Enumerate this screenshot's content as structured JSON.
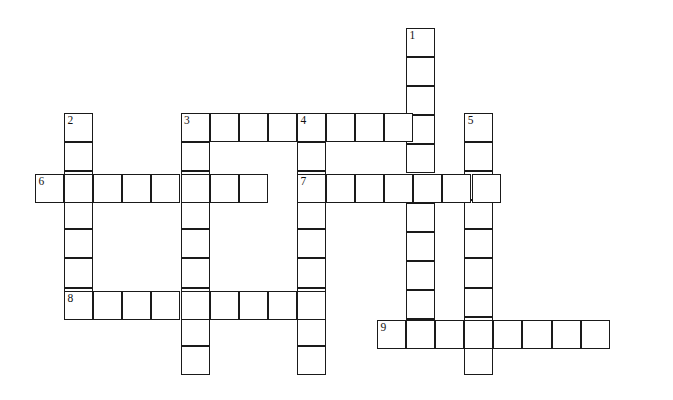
{
  "puzzle": {
    "type": "crossword-grid",
    "title": "Crossword Puzzle Grid",
    "ink_color": "#1a1a1a",
    "cell_color": "#ffffff",
    "background_color": "#ffffff",
    "cell_size": 29.1,
    "origin": {
      "x": 35,
      "y": 28
    },
    "grid_columns": 21,
    "grid_rows": 13,
    "entries": [
      {
        "number": "1",
        "direction": "down",
        "col": 12.75,
        "row": 0,
        "length": 11
      },
      {
        "number": "2",
        "direction": "down",
        "col": 1,
        "row": 2.92,
        "length": 7
      },
      {
        "number": "3",
        "direction": "across",
        "col": 5,
        "row": 2.92,
        "length": 8
      },
      {
        "number": "3",
        "direction": "down",
        "col": 5,
        "row": 2.92,
        "length": 9
      },
      {
        "number": "4",
        "direction": "across",
        "col": 9,
        "row": 2.92,
        "length": 4
      },
      {
        "number": "4",
        "direction": "down",
        "col": 9,
        "row": 2.92,
        "length": 9
      },
      {
        "number": "5",
        "direction": "down",
        "col": 14.75,
        "row": 2.92,
        "length": 9
      },
      {
        "number": "6",
        "direction": "across",
        "col": 0,
        "row": 5.02,
        "length": 8
      },
      {
        "number": "7",
        "direction": "across",
        "col": 9,
        "row": 5.02,
        "length": 7
      },
      {
        "number": "8",
        "direction": "across",
        "col": 1,
        "row": 9.04,
        "length": 9
      },
      {
        "number": "9",
        "direction": "across",
        "col": 11.75,
        "row": 10.04,
        "length": 8
      }
    ],
    "numbers": [
      "1",
      "2",
      "3",
      "4",
      "5",
      "6",
      "7",
      "8",
      "9"
    ]
  }
}
